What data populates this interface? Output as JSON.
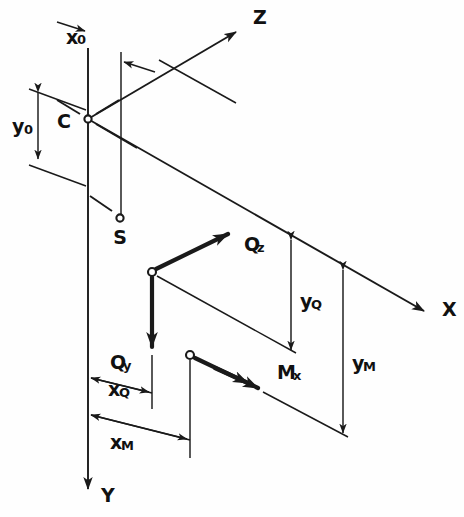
{
  "figure": {
    "type": "engineering-axis-diagram",
    "background_color": "#ffffff",
    "line_color": "#1a1a1a"
  },
  "axes": [
    {
      "id": "z",
      "label": "Z",
      "label_x": 253,
      "label_y": 18,
      "direction": "up-right"
    },
    {
      "id": "x",
      "label": "X",
      "label_x": 442,
      "label_y": 310,
      "direction": "down-right"
    },
    {
      "id": "y",
      "label": "Y",
      "label_x": 101,
      "label_y": 496,
      "direction": "down"
    }
  ],
  "points": [
    {
      "id": "c",
      "label": "C",
      "label_x": 71,
      "label_y": 122,
      "cx": 88,
      "cy": 119,
      "r": 3.6,
      "meaning": "centroid"
    },
    {
      "id": "s",
      "label": "S",
      "label_x": 120,
      "label_y": 238,
      "cx": 120,
      "cy": 218,
      "r": 3.6,
      "meaning": "shear-centre"
    },
    {
      "id": "q",
      "label": "",
      "label_x": 0,
      "label_y": 0,
      "cx": 152,
      "cy": 272,
      "r": 4.0,
      "meaning": "force-application-point"
    },
    {
      "id": "m",
      "label": "",
      "label_x": 0,
      "label_y": 0,
      "cx": 190,
      "cy": 355,
      "r": 4.0,
      "meaning": "moment-application-point"
    }
  ],
  "force_labels": [
    {
      "id": "qz",
      "base": "Q",
      "sub": "z",
      "x": 244,
      "y": 245,
      "sub_dx": 13,
      "sub_dy": 7
    },
    {
      "id": "qy",
      "base": "Q",
      "sub": "y",
      "x": 110,
      "y": 363,
      "sub_dx": 13,
      "sub_dy": 7
    },
    {
      "id": "mx",
      "base": "M",
      "sub": "x",
      "x": 277,
      "y": 373,
      "sub_dx": 16,
      "sub_dy": 7
    }
  ],
  "dimension_labels": [
    {
      "id": "x0",
      "base": "x",
      "sub": "0",
      "x": 66,
      "y": 38,
      "sub_dx": 11,
      "sub_dy": 6
    },
    {
      "id": "y0",
      "base": "y",
      "sub": "0",
      "x": 12,
      "y": 127,
      "sub_dx": 12,
      "sub_dy": 7
    },
    {
      "id": "xq",
      "base": "x",
      "sub": "Q",
      "x": 108,
      "y": 390,
      "sub_dx": 11,
      "sub_dy": 7
    },
    {
      "id": "xm",
      "base": "x",
      "sub": "M",
      "x": 110,
      "y": 443,
      "sub_dx": 11,
      "sub_dy": 7
    },
    {
      "id": "yq",
      "base": "y",
      "sub": "Q",
      "x": 300,
      "y": 302,
      "sub_dx": 11,
      "sub_dy": 7
    },
    {
      "id": "ym",
      "base": "y",
      "sub": "M",
      "x": 352,
      "y": 364,
      "sub_dx": 11,
      "sub_dy": 7
    }
  ],
  "dimensions": [
    {
      "id": "x0",
      "orientation": "horizontal",
      "from": "left-vertical-line",
      "to": "second-vertical-line"
    },
    {
      "id": "y0",
      "orientation": "vertical",
      "from": "top-offset-line",
      "to": "centroid-level-line"
    },
    {
      "id": "xq",
      "orientation": "oblique",
      "from": "y-axis",
      "to": "q-drop-line"
    },
    {
      "id": "xm",
      "orientation": "oblique",
      "from": "y-axis",
      "to": "m-drop-line"
    },
    {
      "id": "yq",
      "orientation": "vertical",
      "from": "x-axis-level",
      "to": "q-horizontal-line"
    },
    {
      "id": "ym",
      "orientation": "vertical",
      "from": "x-axis-level",
      "to": "m-horizontal-line"
    }
  ]
}
